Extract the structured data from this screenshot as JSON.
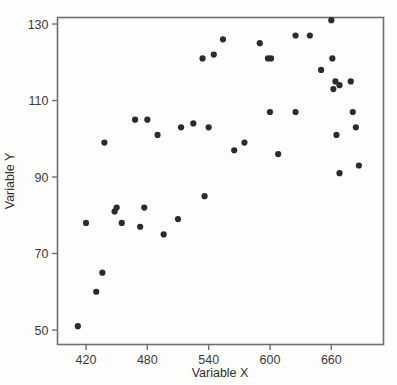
{
  "chart_data": {
    "type": "scatter",
    "title": "",
    "xlabel": "Variable X",
    "ylabel": "Variable Y",
    "xlim": [
      405,
      700
    ],
    "ylim": [
      46,
      134
    ],
    "xticks": [
      420,
      480,
      540,
      600,
      660
    ],
    "yticks": [
      50,
      70,
      90,
      110,
      130
    ],
    "xtick_labels": [
      "420",
      "480",
      "540",
      "600",
      "660"
    ],
    "ytick_labels": [
      "50",
      "70",
      "90",
      "110",
      "130"
    ],
    "grid": false,
    "legend": false,
    "marker": {
      "shape": "circle",
      "color": "#2b2b2b",
      "size_px": 4.4
    },
    "frame": {
      "visible": true,
      "color": "#6f6f6f"
    },
    "n_points": 44,
    "points": [
      {
        "x": 412,
        "y": 51
      },
      {
        "x": 420,
        "y": 78
      },
      {
        "x": 430,
        "y": 60
      },
      {
        "x": 436,
        "y": 65
      },
      {
        "x": 438,
        "y": 99
      },
      {
        "x": 448,
        "y": 81
      },
      {
        "x": 450,
        "y": 82
      },
      {
        "x": 455,
        "y": 78
      },
      {
        "x": 468,
        "y": 105
      },
      {
        "x": 473,
        "y": 77
      },
      {
        "x": 477,
        "y": 82
      },
      {
        "x": 480,
        "y": 105
      },
      {
        "x": 490,
        "y": 101
      },
      {
        "x": 496,
        "y": 75
      },
      {
        "x": 510,
        "y": 79
      },
      {
        "x": 513,
        "y": 103
      },
      {
        "x": 525,
        "y": 104
      },
      {
        "x": 534,
        "y": 121
      },
      {
        "x": 536,
        "y": 85
      },
      {
        "x": 540,
        "y": 103
      },
      {
        "x": 554,
        "y": 126
      },
      {
        "x": 565,
        "y": 97
      },
      {
        "x": 590,
        "y": 125
      },
      {
        "x": 598,
        "y": 121
      },
      {
        "x": 601,
        "y": 121
      },
      {
        "x": 600,
        "y": 107
      },
      {
        "x": 608,
        "y": 96
      },
      {
        "x": 625,
        "y": 127
      },
      {
        "x": 625,
        "y": 107
      },
      {
        "x": 639,
        "y": 127
      },
      {
        "x": 650,
        "y": 118
      },
      {
        "x": 660,
        "y": 131
      },
      {
        "x": 661,
        "y": 121
      },
      {
        "x": 662,
        "y": 113
      },
      {
        "x": 664,
        "y": 115
      },
      {
        "x": 668,
        "y": 114
      },
      {
        "x": 665,
        "y": 101
      },
      {
        "x": 668,
        "y": 91
      },
      {
        "x": 679,
        "y": 115
      },
      {
        "x": 681,
        "y": 107
      },
      {
        "x": 684,
        "y": 103
      },
      {
        "x": 687,
        "y": 93
      },
      {
        "x": 545,
        "y": 122
      },
      {
        "x": 575,
        "y": 99
      }
    ]
  },
  "axis": {
    "x_title": "Variable X",
    "y_title": "Variable Y"
  }
}
